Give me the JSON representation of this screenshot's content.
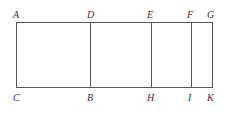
{
  "diagram": {
    "type": "rectangle-subdivided",
    "colors": {
      "line": "#555555",
      "label": "#333333",
      "background": "#ffffff"
    },
    "top_labels": [
      {
        "text": "A",
        "x": 16
      },
      {
        "text": "D",
        "x": 90
      },
      {
        "text": "E",
        "x": 151
      },
      {
        "text": "F",
        "x": 191
      },
      {
        "text": "G",
        "x": 212
      }
    ],
    "bottom_labels": [
      {
        "text": "C",
        "x": 16
      },
      {
        "text": "B",
        "x": 90
      },
      {
        "text": "H",
        "x": 151
      },
      {
        "text": "I",
        "x": 191
      },
      {
        "text": "K",
        "x": 212
      }
    ],
    "segments": [
      {
        "name": "AC",
        "x": 16
      },
      {
        "name": "DB",
        "x": 90
      },
      {
        "name": "EH",
        "x": 151
      },
      {
        "name": "FI",
        "x": 191
      },
      {
        "name": "GK",
        "x": 212
      }
    ]
  }
}
